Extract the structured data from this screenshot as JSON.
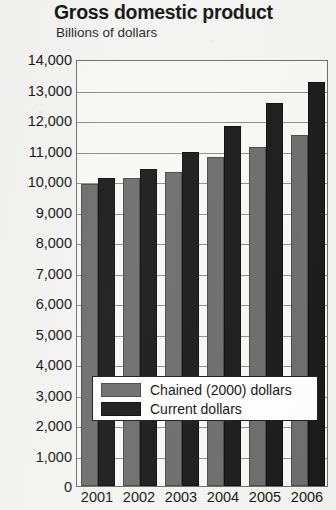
{
  "chart_data": {
    "type": "bar",
    "title": "Gross domestic product",
    "subtitle": "Billions of dollars",
    "xlabel": "",
    "ylabel": "Billions of dollars",
    "categories": [
      "2001",
      "2002",
      "2003",
      "2004",
      "2005",
      "2006"
    ],
    "series": [
      {
        "name": "Chained (2000) dollars",
        "color": "#6d6d6d",
        "values": [
          9900,
          10100,
          10300,
          10800,
          11100,
          11500
        ]
      },
      {
        "name": "Current dollars",
        "color": "#1b1b1b",
        "values": [
          10100,
          10400,
          10950,
          11800,
          12550,
          13250
        ]
      }
    ],
    "ylim": [
      0,
      14000
    ],
    "ytick_labels": [
      "14,000",
      "13,000",
      "12,000",
      "11,000",
      "10,000",
      "9,000",
      "8,000",
      "7,000",
      "6,000",
      "5,000",
      "4,000",
      "3,000",
      "2,000",
      "1,000",
      "0"
    ],
    "ytick_values": [
      14000,
      13000,
      12000,
      11000,
      10000,
      9000,
      8000,
      7000,
      6000,
      5000,
      4000,
      3000,
      2000,
      1000,
      0
    ],
    "grid": true,
    "legend_position": "inside-bottom-center"
  },
  "legend": {
    "entries": [
      {
        "label": "Chained (2000) dollars",
        "swatch": "chained"
      },
      {
        "label": "Current dollars",
        "swatch": "current"
      }
    ]
  }
}
